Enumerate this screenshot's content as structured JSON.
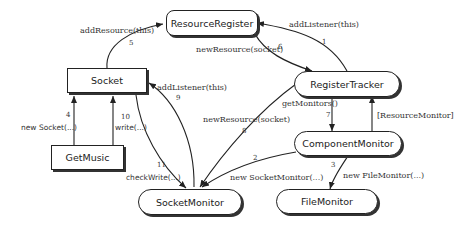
{
  "diagram": {
    "nodes": {
      "resource_register": "ResourceRegister",
      "socket": "Socket",
      "register_tracker": "RegisterTracker",
      "get_music": "GetMusic",
      "component_monitor": "ComponentMonitor",
      "socket_monitor": "SocketMonitor",
      "file_monitor": "FileMonitor"
    },
    "edges": [
      {
        "num": "1",
        "label": "addListener(this)",
        "from": "RegisterTracker",
        "to": "ResourceRegister"
      },
      {
        "num": "2",
        "label": "new SocketMonitor(...)",
        "from": "ComponentMonitor",
        "to": "SocketMonitor"
      },
      {
        "num": "3",
        "label": "new FileMonitor(...)",
        "from": "ComponentMonitor",
        "to": "FileMonitor"
      },
      {
        "num": "4",
        "label": "new Socket(...)",
        "from": "GetMusic",
        "to": "Socket"
      },
      {
        "num": "5",
        "label": "addResource(this)",
        "from": "Socket",
        "to": "ResourceRegister"
      },
      {
        "num": "6",
        "label": "newResource(socket)",
        "from": "ResourceRegister",
        "to": "RegisterTracker"
      },
      {
        "num": "7",
        "label": "getMonitors()",
        "from": "RegisterTracker",
        "to": "ComponentMonitor"
      },
      {
        "num": "8",
        "label": "newResource(socket)",
        "from": "RegisterTracker",
        "to": "SocketMonitor"
      },
      {
        "num": "9",
        "label": "addListener(this)",
        "from": "SocketMonitor",
        "to": "Socket"
      },
      {
        "num": "10",
        "label": "write(...)",
        "from": "GetMusic",
        "to": "Socket"
      },
      {
        "num": "11",
        "label": "checkWrite(...)",
        "from": "Socket",
        "to": "SocketMonitor"
      },
      {
        "num": "",
        "label": "[ResourceMonitor]",
        "from": "ComponentMonitor",
        "to": "RegisterTracker"
      }
    ]
  }
}
